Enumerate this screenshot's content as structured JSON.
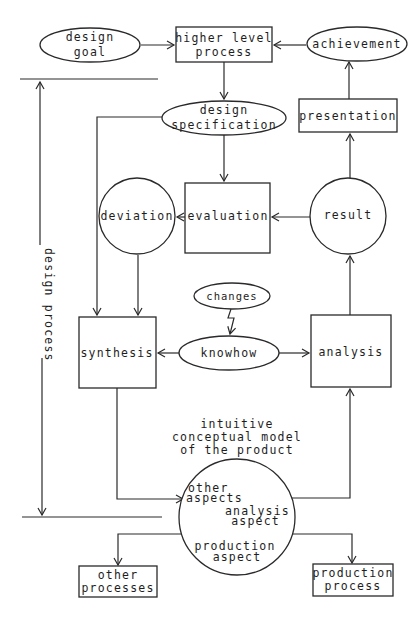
{
  "diagram": {
    "side_label": "design process",
    "nodes": {
      "design_goal": {
        "shape": "ellipse",
        "lines": [
          "design",
          "goal"
        ]
      },
      "higher_level_process": {
        "shape": "rectangle",
        "lines": [
          "higher level",
          "process"
        ]
      },
      "achievement": {
        "shape": "ellipse",
        "lines": [
          "achievement"
        ]
      },
      "design_specification": {
        "shape": "ellipse",
        "lines": [
          "design",
          "specification"
        ]
      },
      "presentation": {
        "shape": "rectangle",
        "lines": [
          "presentation"
        ]
      },
      "deviation": {
        "shape": "circle",
        "lines": [
          "deviation"
        ]
      },
      "evaluation": {
        "shape": "rectangle",
        "lines": [
          "evaluation"
        ]
      },
      "result": {
        "shape": "circle",
        "lines": [
          "result"
        ]
      },
      "changes": {
        "shape": "ellipse",
        "lines": [
          "changes"
        ]
      },
      "knowhow": {
        "shape": "ellipse",
        "lines": [
          "knowhow"
        ]
      },
      "synthesis": {
        "shape": "rectangle",
        "lines": [
          "synthesis"
        ]
      },
      "analysis": {
        "shape": "rectangle",
        "lines": [
          "analysis"
        ]
      },
      "model_caption": {
        "shape": "text",
        "lines": [
          "intuitive",
          "conceptual model",
          "of the product"
        ]
      },
      "model": {
        "shape": "circle",
        "aspects": {
          "other": [
            "other",
            "aspects"
          ],
          "analysis": [
            "analysis",
            "aspect"
          ],
          "production": [
            "production",
            "aspect"
          ]
        }
      },
      "other_processes": {
        "shape": "rectangle",
        "lines": [
          "other",
          "processes"
        ]
      },
      "production_process": {
        "shape": "rectangle",
        "lines": [
          "production",
          "process"
        ]
      }
    },
    "edges": [
      {
        "from": "design goal",
        "to": "higher level process"
      },
      {
        "from": "achievement",
        "to": "higher level process"
      },
      {
        "from": "higher level process",
        "to": "design specification"
      },
      {
        "from": "presentation",
        "to": "achievement"
      },
      {
        "from": "design specification",
        "to": "evaluation"
      },
      {
        "from": "design specification",
        "to": "synthesis"
      },
      {
        "from": "result",
        "to": "evaluation"
      },
      {
        "from": "evaluation",
        "to": "deviation"
      },
      {
        "from": "result",
        "to": "presentation"
      },
      {
        "from": "deviation",
        "to": "synthesis"
      },
      {
        "from": "changes",
        "to": "knowhow",
        "style": "lightning"
      },
      {
        "from": "knowhow",
        "to": "synthesis"
      },
      {
        "from": "knowhow",
        "to": "analysis"
      },
      {
        "from": "analysis",
        "to": "result"
      },
      {
        "from": "synthesis",
        "to": "other aspects"
      },
      {
        "from": "model",
        "to": "analysis"
      },
      {
        "from": "model",
        "to": "other processes"
      },
      {
        "from": "model",
        "to": "production process"
      }
    ],
    "colors": {
      "stroke": "#2a2a2a",
      "background": "#ffffff",
      "text": "#1e1e1e"
    }
  }
}
